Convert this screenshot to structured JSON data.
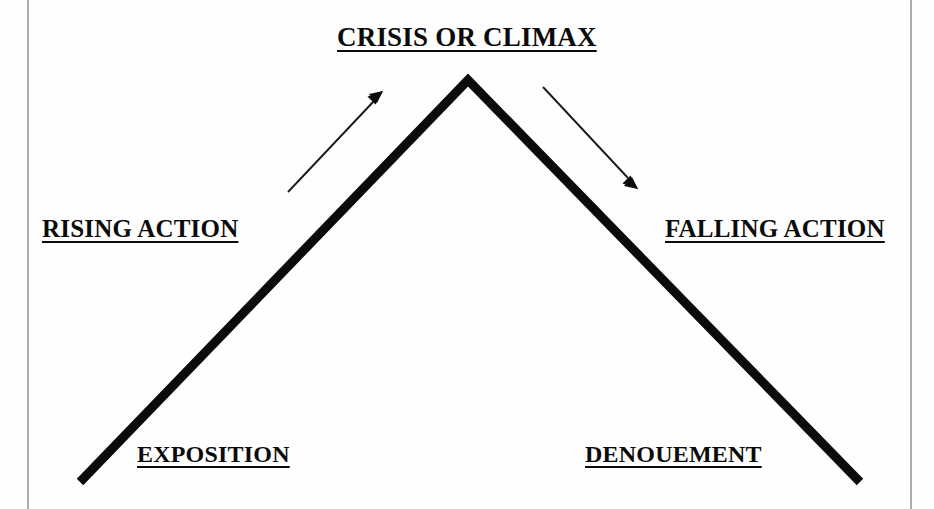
{
  "diagram": {
    "name": "Freytag plot structure diagram",
    "background_color": "#fefefe",
    "ink_color": "#0b0b0b",
    "border_color": "#9a9a9a",
    "labels": {
      "climax": "CRISIS OR CLIMAX",
      "rising_action": "RISING ACTION",
      "falling_action": "FALLING ACTION",
      "exposition": "EXPOSITION",
      "denouement": "DENOUEMENT"
    },
    "shape": {
      "apex_x": 468,
      "apex_y": 80,
      "left_base_x": 80,
      "left_base_y": 482,
      "right_base_x": 860,
      "right_base_y": 482,
      "stroke_width": 9
    },
    "arrows": {
      "rising": {
        "label": "rising-direction-arrow",
        "from_x": 288,
        "from_y": 192,
        "to_x": 383,
        "to_y": 92
      },
      "falling": {
        "label": "falling-direction-arrow",
        "from_x": 543,
        "from_y": 87,
        "to_x": 637,
        "to_y": 188
      }
    },
    "page_rules": {
      "left_margin_x": 28,
      "right_margin_x": 911
    }
  }
}
